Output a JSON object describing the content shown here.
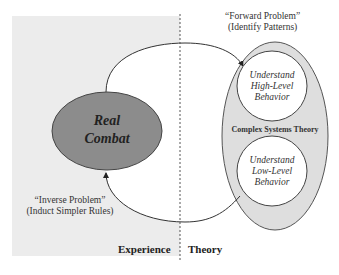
{
  "diagram": {
    "colors": {
      "experience_panel": "#ececec",
      "real_combat_fill": "#8c8c8c",
      "theory_ellipse_fill": "#dedede",
      "circle_fill": "#ffffff",
      "stroke": "#444444"
    },
    "nodes": {
      "real_combat": {
        "line1": "Real",
        "line2": "Combat"
      },
      "high_level": {
        "line1": "Understand",
        "line2": "High-Level",
        "line3": "Behavior"
      },
      "low_level": {
        "line1": "Understand",
        "line2": "Low-Level",
        "line3": "Behavior"
      },
      "complex_systems": "Complex Systems Theory"
    },
    "edges": {
      "forward": {
        "line1": "“Forward Problem”",
        "line2": "(Identify Patterns)"
      },
      "inverse": {
        "line1": "“Inverse Problem”",
        "line2": "(Induct Simpler Rules)"
      }
    },
    "regions": {
      "left": "Experience",
      "right": "Theory"
    }
  }
}
